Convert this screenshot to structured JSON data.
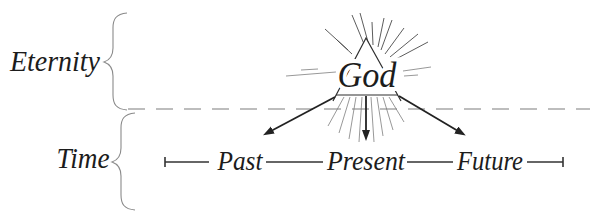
{
  "figure": {
    "background": "#ffffff",
    "ink_color": "#1c1c1c",
    "ray_color": "#4a4a4a",
    "dashed_divider_color": "#a8a8a8",
    "brace_color": "#8a8a8a",
    "eternity_label": "Eternity",
    "time_label": "Time",
    "god_label": "God",
    "timeline": {
      "points": [
        "Past",
        "Present",
        "Future"
      ]
    }
  }
}
